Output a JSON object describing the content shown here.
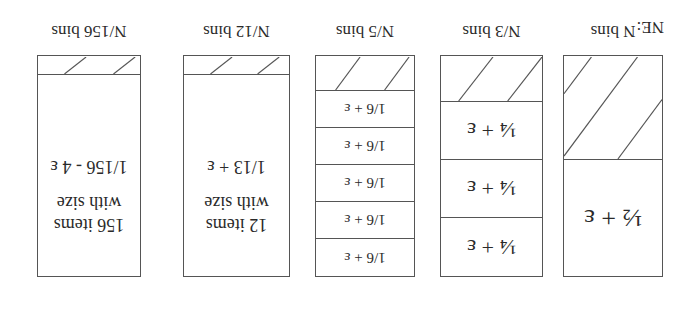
{
  "diagram": {
    "orientation": "rotated 180 degrees",
    "label": "NE:",
    "bins": [
      {
        "caption": "N bins",
        "segments": [
          "½ + ε"
        ],
        "hatched_fraction": "remaining"
      },
      {
        "caption": "N/3 bins",
        "segments": [
          "¼ + ε",
          "¼ + ε",
          "¼ + ε"
        ],
        "hatched_fraction": "remaining"
      },
      {
        "caption": "N/5 bins",
        "segments": [
          "1/6 + ε",
          "1/6 + ε",
          "1/6 + ε",
          "1/6 + ε",
          "1/6 + ε"
        ],
        "hatched_fraction": "remaining"
      },
      {
        "caption": "N/12 bins",
        "content_line1": "12 items",
        "content_line2": "with size",
        "content_line3": "1/13 + ε",
        "hatched_fraction": "remaining"
      },
      {
        "caption": "N/156 bins",
        "content_line1": "156 items",
        "content_line2": "with size",
        "content_line3": "1/156 - 4 ε",
        "hatched_fraction": "remaining"
      }
    ]
  }
}
